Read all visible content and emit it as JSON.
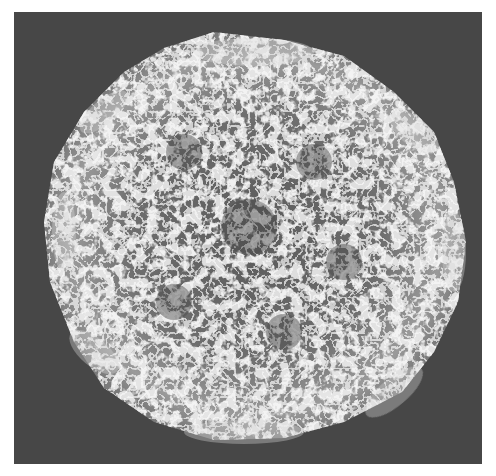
{
  "figure": {
    "background_color": "#474747",
    "page_color": "#ffffff",
    "trace_color": "#e6e6e6",
    "hole_color": "#4a4a4a"
  }
}
